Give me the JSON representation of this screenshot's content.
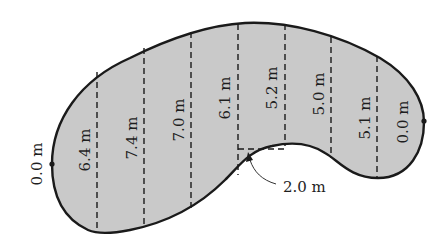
{
  "diagram": {
    "type": "irregular-area-offsets",
    "fill_color": "#c9c9c9",
    "outline_color": "#1a1a1a",
    "end_labels": {
      "left": "0.0 m",
      "right": "0.0 m"
    },
    "offsets": [
      {
        "label": "6.4 m"
      },
      {
        "label": "7.4 m"
      },
      {
        "label": "7.0 m"
      },
      {
        "label": "6.1 m"
      },
      {
        "label": "5.2 m"
      },
      {
        "label": "5.0 m"
      },
      {
        "label": "5.1 m"
      }
    ],
    "spacing_callout": "2.0 m"
  }
}
